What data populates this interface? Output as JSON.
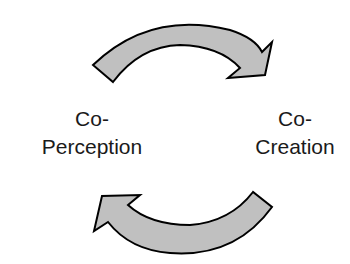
{
  "diagram": {
    "left_label": {
      "line1": "Co-",
      "line2": "Perception"
    },
    "right_label": {
      "line1": "Co-",
      "line2": "Creation"
    },
    "arrows": [
      {
        "name": "top-arrow",
        "direction": "left-to-right",
        "icon": "curved-arrow-right"
      },
      {
        "name": "bottom-arrow",
        "direction": "right-to-left",
        "icon": "curved-arrow-left"
      }
    ],
    "colors": {
      "arrow_fill": "#c0c0c0",
      "arrow_stroke": "#000000",
      "text": "#1a1a1a",
      "background": "#ffffff"
    }
  }
}
